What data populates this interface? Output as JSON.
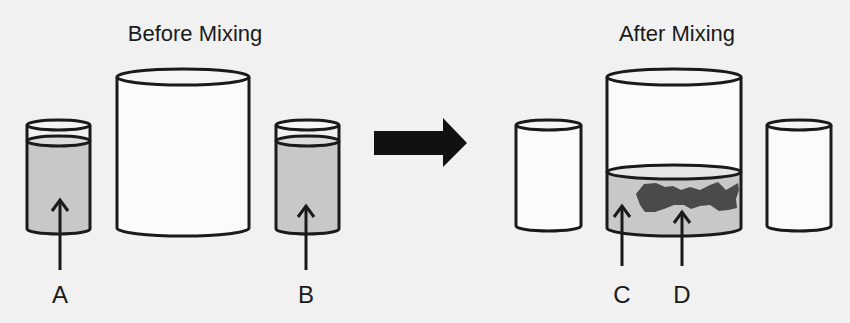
{
  "titles": {
    "before": "Before Mixing",
    "after": "After Mixing"
  },
  "labels": {
    "A": "A",
    "B": "B",
    "C": "C",
    "D": "D"
  },
  "colors": {
    "background": "#f1f1f1",
    "outline": "#1a1a1a",
    "liquid": "#c8c8c8",
    "precipitate": "#4a4a4a",
    "arrow": "#111111"
  }
}
